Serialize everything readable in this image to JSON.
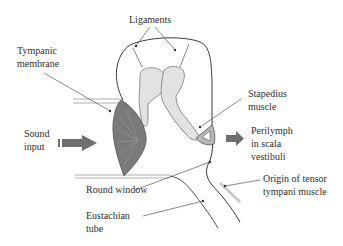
{
  "diagram": {
    "type": "middle-ear schematic",
    "labels": {
      "ligaments": "Ligaments",
      "tympanic_line1": "Tympanic",
      "tympanic_line2": "membrane",
      "sound_line1": "Sound",
      "sound_line2": "input",
      "stapedius_line1": "Stapedius",
      "stapedius_line2": "muscle",
      "perilymph_line1": "Perilymph",
      "perilymph_line2": "in scala",
      "perilymph_line3": "vestibuli",
      "round_window": "Round window",
      "tensor_line1": "Origin of tensor",
      "tensor_line2": "tympani muscle",
      "eustachian_line1": "Eustachian",
      "eustachian_line2": "tube"
    },
    "colors": {
      "outline": "#3a3a3a",
      "membrane_fill": "#7a7a7a",
      "ossicle_fill": "#e2e2e2",
      "stapes_fill": "#b8b8b8",
      "arrow_fill": "#6e6e6e",
      "leader_line": "#555555"
    }
  }
}
